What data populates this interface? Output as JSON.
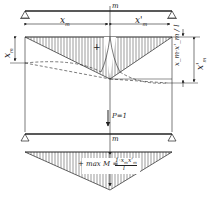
{
  "diagram": {
    "colors": {
      "line": "#222222",
      "hatch": "#555555",
      "background": "#ffffff"
    },
    "top_beam": {
      "section_label": "m"
    },
    "dimensions": {
      "left_span": "x_m",
      "right_span": "x'_m",
      "left_vertical": "x_m",
      "right_vertical": "x'_m",
      "ordinate": "x_m·x'_m / l"
    },
    "labels": {
      "sign_top": "+",
      "load": "P=1",
      "lower_section": "m",
      "sign_bottom": "+",
      "max_moment": "max M = 1·x_m·x'_m / l",
      "max_prefix": "max M =",
      "max_numerator": "1·x",
      "max_numerator_sub": "m",
      "max_numerator_x2": "x'",
      "max_numerator_sub2": "m",
      "max_denominator": "l"
    },
    "text": {
      "xm": "x",
      "m_sub": "m",
      "xm_prime": "x'",
      "frac_top": "x",
      "frac_bottom": "l"
    }
  }
}
